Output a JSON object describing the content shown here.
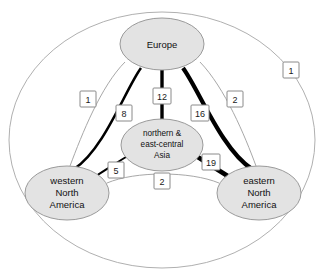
{
  "diagram": {
    "title": "",
    "type": "network-graph",
    "nodes": [
      {
        "id": "europe",
        "label_lines": [
          "Europe"
        ],
        "cx": 162,
        "cy": 44,
        "rx": 42,
        "ry": 26
      },
      {
        "id": "asia",
        "label_lines": [
          "northern &",
          "east-central",
          "Asia"
        ],
        "cx": 162,
        "cy": 145,
        "rx": 41,
        "ry": 26
      },
      {
        "id": "western-north-america",
        "label_lines": [
          "western",
          "North",
          "America"
        ],
        "cx": 67,
        "cy": 193,
        "rx": 42,
        "ry": 27
      },
      {
        "id": "eastern-north-america",
        "label_lines": [
          "eastern",
          "North",
          "America"
        ],
        "cx": 259,
        "cy": 193,
        "rx": 42,
        "ry": 27
      }
    ],
    "edges": [
      {
        "id": "europe-asia",
        "from": "europe",
        "to": "asia",
        "weight": "12",
        "style": "thick",
        "width": 3.4,
        "label_x": 162,
        "label_y": 96
      },
      {
        "id": "europe-western-north-america",
        "from": "europe",
        "to": "western-north-america",
        "weight": "8",
        "style": "thick",
        "width": 2.6,
        "label_x": 124,
        "label_y": 113
      },
      {
        "id": "europe-eastern-north-america",
        "from": "europe",
        "to": "eastern-north-america",
        "weight": "16",
        "style": "thick",
        "width": 4.2,
        "label_x": 200,
        "label_y": 113
      },
      {
        "id": "asia-western-north-america",
        "from": "asia",
        "to": "western-north-america",
        "weight": "5",
        "style": "thick",
        "width": 2.0,
        "label_x": 116,
        "label_y": 170
      },
      {
        "id": "asia-eastern-north-america",
        "from": "asia",
        "to": "eastern-north-america",
        "weight": "19",
        "style": "thick",
        "width": 4.6,
        "label_x": 211,
        "label_y": 162
      },
      {
        "id": "europe-western-north-america-thin",
        "from": "europe",
        "to": "western-north-america",
        "weight": "1",
        "style": "thin",
        "width": 1,
        "label_x": 88,
        "label_y": 99
      },
      {
        "id": "europe-eastern-north-america-thin",
        "from": "europe",
        "to": "eastern-north-america",
        "weight": "2",
        "style": "thin",
        "width": 1,
        "label_x": 235,
        "label_y": 99
      },
      {
        "id": "western-eastern-north-america-thin",
        "from": "western-north-america",
        "to": "eastern-north-america",
        "weight": "2",
        "style": "thin",
        "width": 1,
        "label_x": 162,
        "label_y": 181
      },
      {
        "id": "outer-ring-edge",
        "from": "europe",
        "to": "eastern-north-america",
        "weight": "1",
        "style": "thin-outer",
        "width": 1,
        "label_x": 291,
        "label_y": 70
      }
    ],
    "colors": {
      "node_fill": "#e3e3e3",
      "node_stroke": "#9a9a9a",
      "thick_edge": "#000000",
      "thin_edge": "#a8a8a8",
      "outer_ring": "#b0b0b0",
      "label_box_fill": "#ffffff",
      "label_box_stroke": "#8a8a8a",
      "text": "#111111",
      "background": "#ffffff"
    }
  }
}
